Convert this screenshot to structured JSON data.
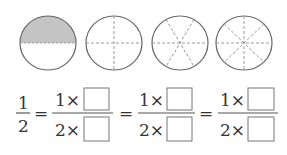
{
  "circles": [
    {
      "parts": 2,
      "shaded": 1,
      "label": "half-circle"
    },
    {
      "parts": 4,
      "shaded": 0,
      "label": "quarters-circle"
    },
    {
      "parts": 6,
      "shaded": 0,
      "label": "sixths-circle"
    },
    {
      "parts": 8,
      "shaded": 0,
      "label": "eighths-circle"
    }
  ],
  "colors": {
    "outline": "#666666",
    "shade": "#c4c4c4",
    "dash": "#9a9a9a"
  },
  "equation": {
    "lhs": {
      "numerator": "1",
      "denominator": "2"
    },
    "equals": "=",
    "fractions": [
      {
        "numerator": "1×",
        "denominator": "2×"
      },
      {
        "numerator": "1×",
        "denominator": "2×"
      },
      {
        "numerator": "1×",
        "denominator": "2×"
      }
    ]
  }
}
